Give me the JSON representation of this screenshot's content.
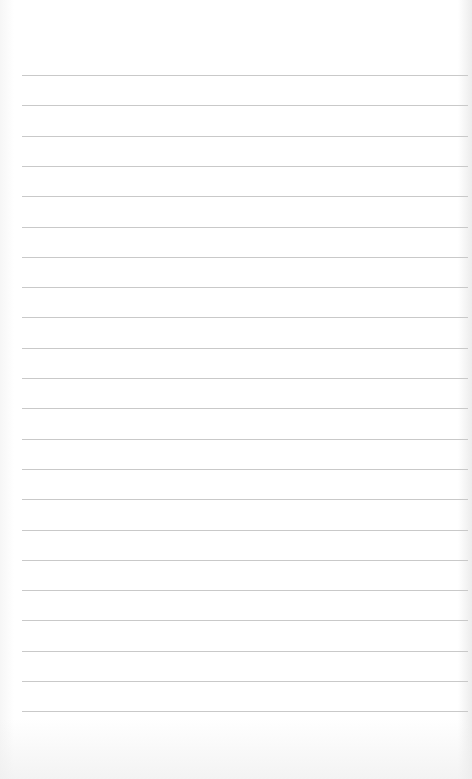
{
  "page": {
    "type": "lined-paper",
    "background_color": "#ffffff",
    "rule_color": "#c9c9c9",
    "rule_count": 22,
    "first_rule_y": 75,
    "rule_spacing": 30.3,
    "rule_left": 22,
    "rule_right": 468
  }
}
